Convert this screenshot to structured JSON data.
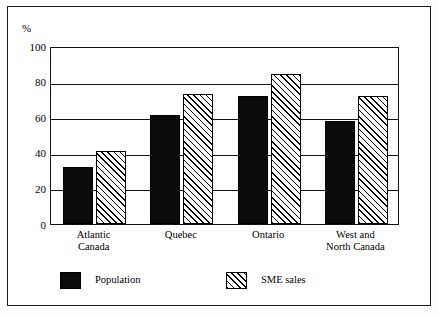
{
  "chart_data": {
    "type": "bar",
    "title": "",
    "subtitle": "",
    "xlabel": "",
    "ylabel": "%",
    "ylim": [
      0,
      100
    ],
    "yticks": [
      0,
      20,
      40,
      60,
      80,
      100
    ],
    "ytick_labels": [
      "0",
      "20",
      "40",
      "60",
      "80",
      "100"
    ],
    "grid": true,
    "grid_axis": "y",
    "legend_position": "bottom-left",
    "categories": [
      "Atlantic Canada",
      "Quebec",
      "Ontario",
      "West and North Canada"
    ],
    "category_label_lines": [
      [
        "Atlantic",
        "Canada"
      ],
      [
        "Quebec",
        ""
      ],
      [
        "Ontario",
        ""
      ],
      [
        "West and",
        "North Canada"
      ]
    ],
    "series": [
      {
        "name": "Population",
        "fill": "solid-black",
        "color": "#0b0b0b",
        "values": [
          32,
          61,
          72,
          58
        ]
      },
      {
        "name": "SME sales",
        "fill": "diagonal-hatch",
        "color": "#ffffff",
        "values": [
          41,
          73,
          84,
          72
        ]
      }
    ]
  },
  "axes": {
    "y_unit_label": "%"
  },
  "legend": {
    "items": [
      {
        "label": "Population",
        "swatch": "solid-black-swatch"
      },
      {
        "label": "SME sales",
        "swatch": "hatched-swatch"
      }
    ]
  },
  "colors": {
    "bar_population": "#0b0b0b",
    "bar_sme_sales": "#ffffff",
    "hatch": "#000000",
    "axis": "#111111",
    "frame": "#1a1a1a",
    "background": "#ffffff"
  }
}
